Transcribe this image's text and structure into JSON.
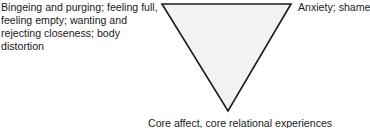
{
  "diagram": {
    "type": "inverted-triangle",
    "shape": {
      "fill": "#f2f2f2",
      "stroke": "#1a1a1a",
      "points": [
        [
          162,
          4
        ],
        [
          291,
          4
        ],
        [
          228,
          111
        ]
      ]
    },
    "corners": {
      "top_left": "Bingeing and purging; feeling full, feeling empty; wanting and rejecting closeness; body distortion",
      "top_right": "Anxiety; shame",
      "bottom": "Core affect, core relational experiences"
    }
  }
}
